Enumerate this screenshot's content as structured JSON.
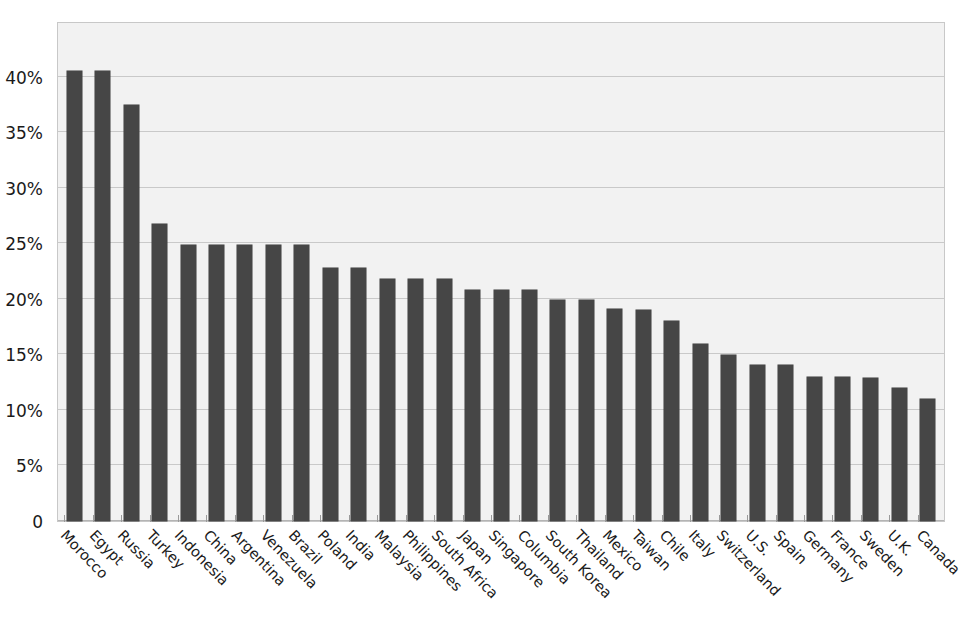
{
  "chart": {
    "title_sliver": ".",
    "axis": {
      "y_ticks": [
        "0",
        "5%",
        "10%",
        "15%",
        "20%",
        "25%",
        "30%",
        "35%",
        "40%"
      ]
    },
    "colors": {
      "bar": "#464646",
      "plot_background": "#f2f2f2",
      "gridline": "#c9c9c9",
      "plot_border": "#c8c8c8",
      "text": "#1a1a1a"
    }
  },
  "chart_data": {
    "type": "bar",
    "title": "",
    "subtitle": "",
    "xlabel": "",
    "ylabel": "",
    "ylim": [
      0,
      45
    ],
    "grid": true,
    "legend": false,
    "y_tick_values": [
      0,
      5,
      10,
      15,
      20,
      25,
      30,
      35,
      40
    ],
    "y_tick_labels": [
      "0",
      "5%",
      "10%",
      "15%",
      "20%",
      "25%",
      "30%",
      "35%",
      "40%"
    ],
    "value_unit": "percent",
    "categories": [
      "Morocco",
      "Egypt",
      "Russia",
      "Turkey",
      "Indonesia",
      "China",
      "Argentina",
      "Venezuela",
      "Brazil",
      "Poland",
      "India",
      "Malaysia",
      "Philippines",
      "South Africa",
      "Japan",
      "Singapore",
      "Columbia",
      "South Korea",
      "Thailand",
      "Mexico",
      "Taiwan",
      "Chile",
      "Italy",
      "Switzerland",
      "U.S.",
      "Spain",
      "Germany",
      "France",
      "Sweden",
      "U.K.",
      "Canada"
    ],
    "values": [
      40.5,
      40.5,
      37.4,
      26.7,
      24.8,
      24.8,
      24.8,
      24.8,
      24.8,
      22.8,
      22.8,
      21.8,
      21.8,
      21.8,
      20.8,
      20.8,
      20.8,
      19.9,
      19.9,
      19.1,
      19.0,
      18.0,
      15.9,
      14.9,
      14.0,
      14.0,
      13.0,
      13.0,
      12.9,
      12.0,
      11.0
    ]
  }
}
